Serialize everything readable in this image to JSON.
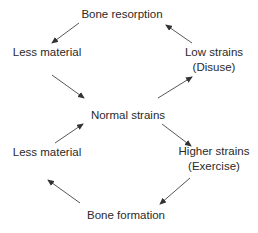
{
  "nodes": {
    "bone_resorption": {
      "lines": [
        "Bone resorption"
      ]
    },
    "less_material_top": {
      "lines": [
        "Less material"
      ]
    },
    "low_strains": {
      "lines": [
        "Low strains",
        "(Disuse)"
      ]
    },
    "normal_strains": {
      "lines": [
        "Normal strains"
      ]
    },
    "less_material_bottom": {
      "lines": [
        "Less material"
      ]
    },
    "higher_strains": {
      "lines": [
        "Higher strains",
        "(Exercise)"
      ]
    },
    "bone_formation": {
      "lines": [
        "Bone formation"
      ]
    }
  },
  "edges": [
    {
      "from": "bone_resorption",
      "to": "less_material_top"
    },
    {
      "from": "less_material_top",
      "to": "normal_strains"
    },
    {
      "from": "normal_strains",
      "to": "low_strains"
    },
    {
      "from": "low_strains",
      "to": "bone_resorption"
    },
    {
      "from": "less_material_bottom",
      "to": "normal_strains"
    },
    {
      "from": "normal_strains",
      "to": "higher_strains"
    },
    {
      "from": "higher_strains",
      "to": "bone_formation"
    },
    {
      "from": "bone_formation",
      "to": "less_material_bottom"
    }
  ]
}
